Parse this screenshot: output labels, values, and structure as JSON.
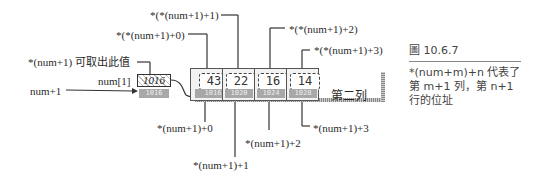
{
  "figure": {
    "number": "圖 10.6.7",
    "description": "*(num+m)+n  代表了第 m+1 列，第 n+1 行的位址"
  },
  "pointer": {
    "var_label": "num+1",
    "element_label": "num[1]",
    "value": "1016",
    "address": "1016",
    "deref_note": "*(num+1)  可取出此值"
  },
  "row": {
    "label": "第二列",
    "cells": [
      {
        "value": "43",
        "address": "1016",
        "top_label": "*(*(num+1)+0)",
        "bottom_label": "*(num+1)+0"
      },
      {
        "value": "22",
        "address": "1020",
        "top_label": "*(*(num+1)+1)",
        "bottom_label": "*(num+1)+1"
      },
      {
        "value": "16",
        "address": "1024",
        "top_label": "*(*(num+1)+2)",
        "bottom_label": "*(num+1)+2"
      },
      {
        "value": "14",
        "address": "1028",
        "top_label": "*(*(num+1)+3)",
        "bottom_label": "*(num+1)+3"
      }
    ]
  },
  "colors": {
    "line": "#333333",
    "address_bg": "#a8a8a8",
    "cell_bg": "#f2f2f2"
  }
}
